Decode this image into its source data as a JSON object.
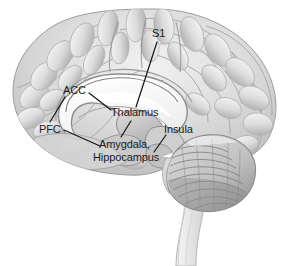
{
  "figure": {
    "kind": "anatomical-illustration",
    "background_color": "#ffffff",
    "palette": {
      "cortex_fill": "#d9d9d9",
      "cortex_highlight": "#f2f2f2",
      "cortex_shadow": "#b4b4b4",
      "outline": "#9a9a9a",
      "white_matter": "#fbfbfb",
      "corpus_callosum_edge": "#8e8e8e",
      "deep_structure": "#c4c4c4",
      "cerebellum_fill": "#cfcfcf",
      "cerebellum_shadow": "#9f9f9f",
      "brainstem_fill": "#f0f0f0",
      "label_text": "#1b1b1b",
      "leader_line": "#141414"
    }
  },
  "labels": [
    {
      "id": "s1",
      "text": "S1",
      "x": 152,
      "y": 27
    },
    {
      "id": "acc",
      "text": "ACC",
      "x": 63,
      "y": 84
    },
    {
      "id": "thalamus",
      "text": "Thalamus",
      "x": 111,
      "y": 106
    },
    {
      "id": "pfc",
      "text": "PFC",
      "x": 39,
      "y": 123
    },
    {
      "id": "insula",
      "text": "Insula",
      "x": 164,
      "y": 123
    },
    {
      "id": "amygdala",
      "text": "Amygdala,",
      "x": 99,
      "y": 138
    },
    {
      "id": "hippocampus",
      "text": "Hippocampus",
      "x": 93,
      "y": 151
    }
  ],
  "leader_lines": [
    {
      "id": "s1-leader",
      "from": [
        157,
        42
      ],
      "to": [
        136,
        107
      ]
    },
    {
      "id": "acc-leader-left",
      "from": [
        65,
        97
      ],
      "to": [
        50,
        122
      ]
    },
    {
      "id": "acc-leader-right",
      "from": [
        89,
        93
      ],
      "to": [
        111,
        110
      ]
    },
    {
      "id": "thalamus-leader",
      "from": [
        131,
        121
      ],
      "to": [
        121,
        137
      ]
    },
    {
      "id": "pfc-leader",
      "from": [
        64,
        130
      ],
      "to": [
        100,
        146
      ]
    },
    {
      "id": "insula-leader",
      "from": [
        166,
        135
      ],
      "to": [
        154,
        152
      ]
    }
  ]
}
